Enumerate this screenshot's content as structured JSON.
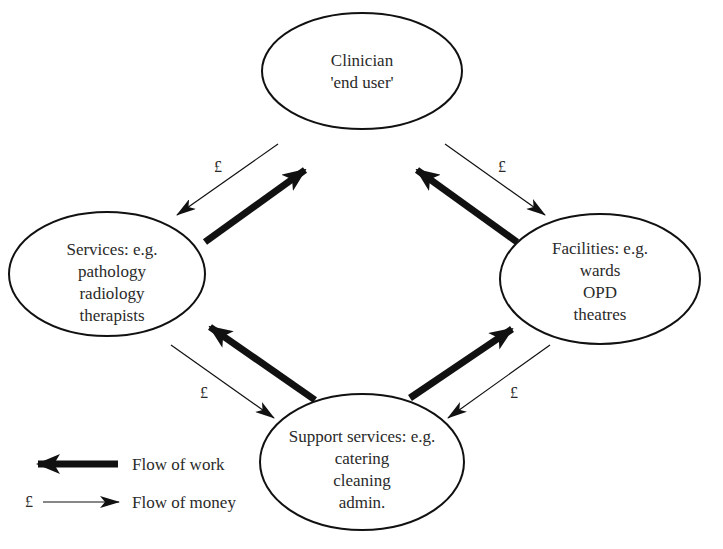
{
  "nodes": {
    "clinician": {
      "lines": [
        "Clinician",
        "'end user'"
      ]
    },
    "services": {
      "lines": [
        "Services: e.g.",
        "pathology",
        "radiology",
        "therapists"
      ]
    },
    "facilities": {
      "lines": [
        "Facilities: e.g.",
        "wards",
        "OPD",
        "theatres"
      ]
    },
    "support": {
      "lines": [
        "Support services: e.g.",
        "catering",
        "cleaning",
        "admin."
      ]
    }
  },
  "edges": {
    "money_symbol": "£",
    "money_clinician_to_services": "£",
    "money_clinician_to_facilities": "£",
    "money_services_to_support": "£",
    "money_facilities_to_support": "£"
  },
  "legend": {
    "work_label": "Flow of work",
    "money_symbol": "£",
    "money_label": "Flow of money"
  },
  "colors": {
    "line": "#111111",
    "text": "#2a2a2a",
    "background": "#ffffff"
  }
}
